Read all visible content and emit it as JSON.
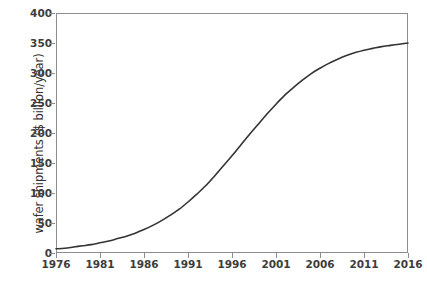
{
  "chart_data": {
    "type": "line",
    "title": "",
    "xlabel": "",
    "ylabel": "wafer shipments ($ billion/year)",
    "xlim": [
      1976,
      2016
    ],
    "ylim": [
      0,
      400
    ],
    "grid": false,
    "legend": null,
    "x_ticks": [
      "1976",
      "1981",
      "1986",
      "1991",
      "1996",
      "2001",
      "2006",
      "2011",
      "2016"
    ],
    "x_tick_values": [
      1976,
      1981,
      1986,
      1991,
      1996,
      2001,
      2006,
      2011,
      2016
    ],
    "y_ticks": [
      "0",
      "50",
      "100",
      "150",
      "200",
      "250",
      "300",
      "350",
      "400"
    ],
    "y_tick_values": [
      0,
      50,
      100,
      150,
      200,
      250,
      300,
      350,
      400
    ],
    "series": [
      {
        "name": "wafer shipments",
        "color": "#333333",
        "line_width": 1.6,
        "x": [
          1976,
          1977,
          1978,
          1979,
          1980,
          1981,
          1982,
          1983,
          1984,
          1985,
          1986,
          1987,
          1988,
          1989,
          1990,
          1991,
          1992,
          1993,
          1994,
          1995,
          1996,
          1997,
          1998,
          1999,
          2000,
          2001,
          2002,
          2003,
          2004,
          2005,
          2006,
          2007,
          2008,
          2009,
          2010,
          2011,
          2012,
          2013,
          2014,
          2015,
          2016
        ],
        "values": [
          7,
          8,
          10,
          12,
          14,
          17,
          20,
          24,
          28,
          33,
          39,
          46,
          54,
          63,
          73,
          85,
          98,
          112,
          128,
          145,
          162,
          180,
          198,
          215,
          232,
          248,
          263,
          276,
          288,
          299,
          308,
          316,
          323,
          329,
          334,
          338,
          341,
          344,
          346,
          348,
          350
        ]
      }
    ],
    "annotations": []
  },
  "axis": {
    "frame_color": "#8d8d8d",
    "tick_label_color": "#3d3d3d",
    "title_color": "#2f2f2f"
  }
}
